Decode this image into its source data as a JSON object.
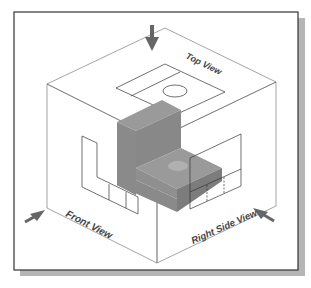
{
  "diagram": {
    "labels": {
      "top_view": "Top View",
      "front_view": "Front View",
      "right_side_view": "Right Side View"
    },
    "colors": {
      "frame_border": "#333333",
      "frame_shadow": "#b5b5b5",
      "box_line": "#555555",
      "solid_top": "#9a9a9a",
      "solid_front": "#8a8a8a",
      "solid_side": "#7c7c7c",
      "arrow": "#666666",
      "label": "#444444"
    },
    "viewing_arrows": [
      {
        "name": "top",
        "direction": "down"
      },
      {
        "name": "front",
        "direction": "from-left"
      },
      {
        "name": "right",
        "direction": "from-right"
      }
    ]
  }
}
